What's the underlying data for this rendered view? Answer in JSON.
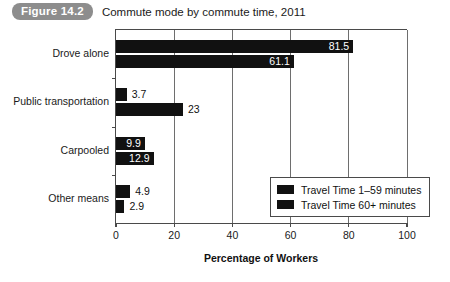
{
  "figure": {
    "badge": "Figure 14.2",
    "title": "Commute mode by commute time, 2011"
  },
  "chart_data": {
    "type": "bar",
    "orientation": "horizontal",
    "title": "Commute mode by commute time, 2011",
    "xlabel": "Percentage of Workers",
    "ylabel": "",
    "xlim": [
      0,
      100
    ],
    "xticks": [
      "0",
      "20",
      "40",
      "60",
      "80",
      "100"
    ],
    "grid": "vertical",
    "legend_position": "inside-bottom-right",
    "categories": [
      "Drove alone",
      "Public transportation",
      "Carpooled",
      "Other means"
    ],
    "series": [
      {
        "name": "Travel Time 1–59 minutes",
        "color": "#111111",
        "values": [
          81.5,
          3.7,
          9.9,
          4.9
        ],
        "labels": [
          "81.5",
          "3.7",
          "9.9",
          "4.9"
        ],
        "label_placement": [
          "inside",
          "outside",
          "inside",
          "outside"
        ]
      },
      {
        "name": "Travel Time 60+ minutes",
        "color": "#111111",
        "values": [
          61.1,
          23,
          12.9,
          2.9
        ],
        "labels": [
          "61.1",
          "23",
          "12.9",
          "2.9"
        ],
        "label_placement": [
          "inside",
          "outside",
          "inside",
          "outside"
        ]
      }
    ]
  },
  "legend": {
    "items": [
      {
        "label": "Travel Time 1–59 minutes",
        "color": "#111111"
      },
      {
        "label": "Travel Time 60+ minutes",
        "color": "#111111"
      }
    ]
  },
  "colors": {
    "bar": "#111111",
    "badge_bg": "#8d8d8d",
    "axis": "#4a4a4a",
    "grid": "#6e6e6e"
  }
}
